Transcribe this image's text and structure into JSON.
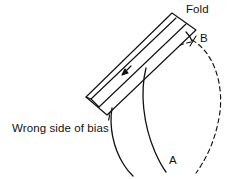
{
  "figure": {
    "background_color": "#ffffff",
    "stroke_color": "#111111",
    "width": 234,
    "height": 179,
    "labels": {
      "fold": "Fold",
      "point_b": "B",
      "point_a": "A",
      "wrong_side": "Wrong side of bias"
    },
    "elements": {
      "strip_name": "bias-strip",
      "strip_style": "solid outline parallelogram, folded lengthwise",
      "curve_a_style": "solid",
      "curve_b_style": "dashed",
      "curve_left_style": "solid",
      "curve_hidden_style": "dashed",
      "arrow_name": "fold-direction-arrow"
    }
  }
}
